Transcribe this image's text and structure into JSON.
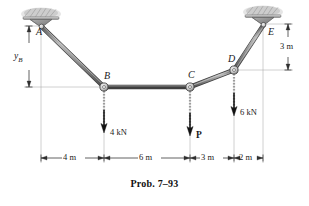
{
  "figure": {
    "caption": "Prob. 7–93",
    "type": "cable-structure-free-body-diagram",
    "background_color": "#ffffff",
    "cable_color": "#8c8c8c",
    "cable_edge_color": "#4a4a4a",
    "support_fill": "#9a9a9a",
    "dimension_line_color": "#3c3c3c",
    "ceiling_hatch_color": "#b5b5b5"
  },
  "nodes": [
    {
      "id": "A",
      "label": "A",
      "x": 41,
      "y": 26,
      "kind": "support-anchor-left",
      "pin": false
    },
    {
      "id": "B",
      "label": "B",
      "x": 104,
      "y": 87,
      "kind": "pin-joint",
      "pin": true
    },
    {
      "id": "C",
      "label": "C",
      "x": 190,
      "y": 87,
      "kind": "pin-joint",
      "pin": true
    },
    {
      "id": "D",
      "label": "D",
      "x": 234,
      "y": 70,
      "kind": "pin-joint",
      "pin": true
    },
    {
      "id": "E",
      "label": "E",
      "x": 263,
      "y": 24,
      "kind": "support-anchor-right",
      "pin": false
    }
  ],
  "members": [
    {
      "from": "A",
      "to": "B"
    },
    {
      "from": "B",
      "to": "C"
    },
    {
      "from": "C",
      "to": "D"
    },
    {
      "from": "D",
      "to": "E"
    }
  ],
  "supports": [
    {
      "id": "support-left",
      "label": "A",
      "x": 41,
      "y": 22,
      "pad_width": 36,
      "pad_height": 9
    },
    {
      "id": "support-right",
      "label": "E",
      "x": 263,
      "y": 20,
      "pad_width": 36,
      "pad_height": 9
    }
  ],
  "forces": [
    {
      "id": "force-b",
      "at_node": "B",
      "label": "4 kN",
      "magnitude": 4,
      "unit": "kN",
      "direction": "down",
      "bold": false,
      "x": 104,
      "y_start": 90,
      "y_end": 130
    },
    {
      "id": "force-c",
      "at_node": "C",
      "label": "P",
      "magnitude": null,
      "unit": "",
      "direction": "down",
      "bold": true,
      "x": 190,
      "y_start": 90,
      "y_end": 133
    },
    {
      "id": "force-d",
      "at_node": "D",
      "label": "6 kN",
      "magnitude": 6,
      "unit": "kN",
      "direction": "down",
      "bold": false,
      "x": 234,
      "y_start": 73,
      "y_end": 113
    }
  ],
  "dimensions": {
    "horizontal": {
      "line_y": 158,
      "segments": [
        {
          "id": "dim-ab",
          "label": "4 m",
          "value": 4,
          "unit": "m",
          "x_start": 41,
          "x_end": 104
        },
        {
          "id": "dim-bc",
          "label": "6 m",
          "value": 6,
          "unit": "m",
          "x_start": 104,
          "x_end": 190
        },
        {
          "id": "dim-cd",
          "label": "3 m",
          "value": 3,
          "unit": "m",
          "x_start": 190,
          "x_end": 234
        },
        {
          "id": "dim-de",
          "label": "2 m",
          "value": 2,
          "unit": "m",
          "x_start": 234,
          "x_end": 263
        }
      ]
    },
    "vertical": [
      {
        "id": "dim-yb",
        "label": "y",
        "sublabel": "B",
        "value": null,
        "unit": "",
        "x": 29,
        "y_start": 26,
        "y_end": 87
      },
      {
        "id": "dim-right-3m",
        "label": "3 m",
        "value": 3,
        "unit": "m",
        "x": 288,
        "y_start": 24,
        "y_end": 70
      }
    ]
  },
  "labels": {
    "node_a": "A",
    "node_b": "B",
    "node_c": "C",
    "node_d": "D",
    "node_e": "E",
    "yb_main": "y",
    "yb_sub": "B",
    "force_b": "4 kN",
    "force_c": "P",
    "force_d": "6 kN",
    "dim_4m": "4 m",
    "dim_6m": "6 m",
    "dim_3m": "3 m",
    "dim_2m": "2 m",
    "dim_right_3m": "3 m",
    "caption": "Prob. 7–93"
  }
}
